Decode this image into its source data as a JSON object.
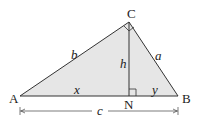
{
  "diagram": {
    "type": "right-triangle-altitude",
    "vertices": {
      "A": {
        "label": "A",
        "x": 20,
        "y": 96
      },
      "B": {
        "label": "B",
        "x": 178,
        "y": 96
      },
      "C": {
        "label": "C",
        "x": 129,
        "y": 22
      },
      "N": {
        "label": "N",
        "x": 129,
        "y": 96
      }
    },
    "side_labels": {
      "b": "b",
      "a": "a",
      "h": "h",
      "x": "x",
      "y": "y",
      "c": "c"
    },
    "colors": {
      "fill": "#e6e6e6",
      "stroke": "#333333"
    }
  }
}
